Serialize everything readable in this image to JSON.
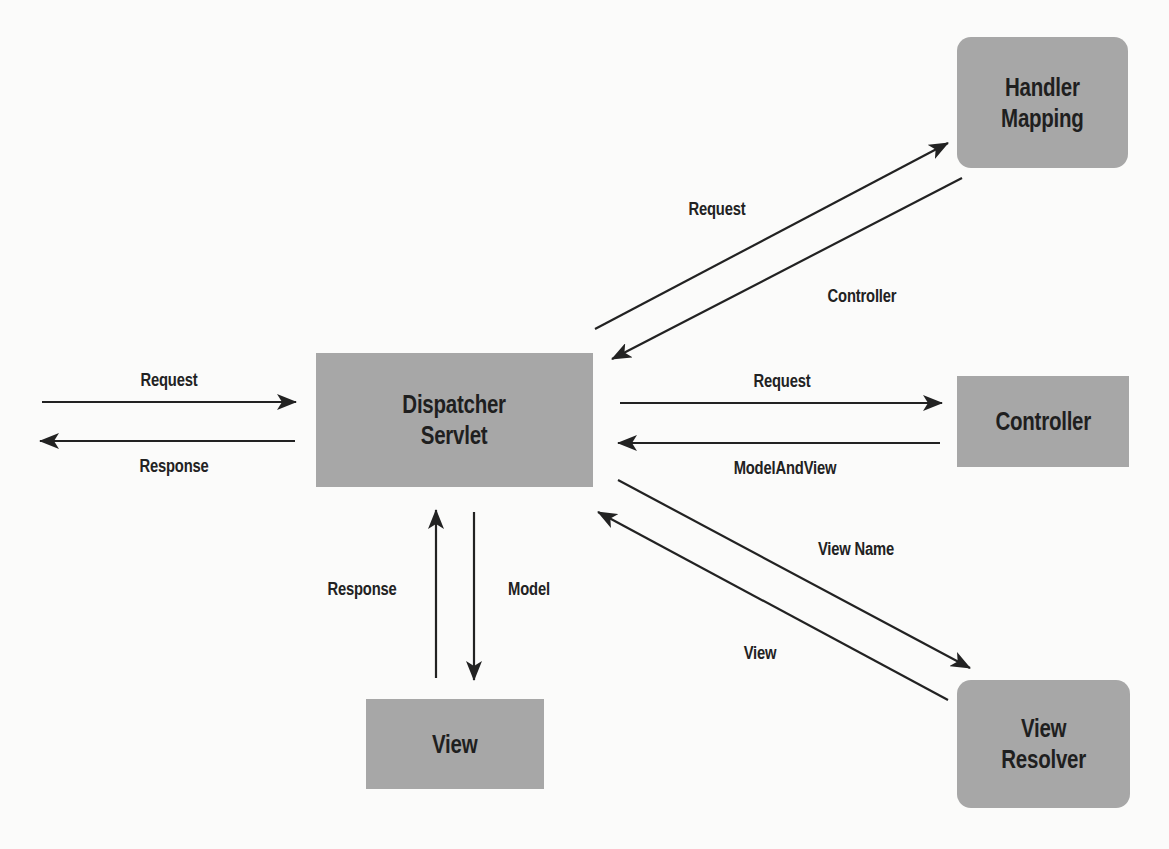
{
  "diagram": {
    "colors": {
      "node_fill": "#a7a7a7",
      "text": "#1f1f1f",
      "arrow": "#222222",
      "background": "#fbfbfa"
    },
    "nodes": {
      "dispatcher": {
        "line1": "Dispatcher",
        "line2": "Servlet",
        "shape": "rectangle"
      },
      "handler_mapping": {
        "line1": "Handler",
        "line2": "Mapping",
        "shape": "rounded-rectangle"
      },
      "controller": {
        "line1": "Controller",
        "shape": "rectangle"
      },
      "view_resolver": {
        "line1": "View",
        "line2": "Resolver",
        "shape": "rounded-rectangle"
      },
      "view": {
        "line1": "View",
        "shape": "rectangle"
      }
    },
    "edges": [
      {
        "id": "client-request",
        "from": "client",
        "to": "Dispatcher Servlet",
        "label": "Request"
      },
      {
        "id": "client-response",
        "from": "Dispatcher Servlet",
        "to": "client",
        "label": "Response"
      },
      {
        "id": "hm-request",
        "from": "Dispatcher Servlet",
        "to": "Handler Mapping",
        "label": "Request"
      },
      {
        "id": "hm-controller",
        "from": "Handler Mapping",
        "to": "Dispatcher Servlet",
        "label": "Controller"
      },
      {
        "id": "ctrl-request",
        "from": "Dispatcher Servlet",
        "to": "Controller",
        "label": "Request"
      },
      {
        "id": "ctrl-mav",
        "from": "Controller",
        "to": "Dispatcher Servlet",
        "label": "ModelAndView"
      },
      {
        "id": "vr-viewname",
        "from": "Dispatcher Servlet",
        "to": "View Resolver",
        "label": "View Name"
      },
      {
        "id": "vr-view",
        "from": "View Resolver",
        "to": "Dispatcher Servlet",
        "label": "View"
      },
      {
        "id": "view-model",
        "from": "Dispatcher Servlet",
        "to": "View",
        "label": "Model"
      },
      {
        "id": "view-response",
        "from": "View",
        "to": "Dispatcher Servlet",
        "label": "Response"
      }
    ]
  }
}
